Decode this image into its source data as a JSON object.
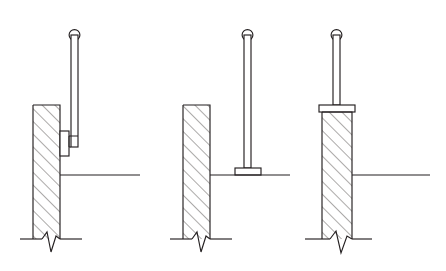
{
  "drawing": {
    "title": "Railing / Standard Mounting Details",
    "sheet_background": "#ffffff",
    "line_color": "#231f20",
    "hatch_color": "#3a3634",
    "style": "line-drawing",
    "figure_count": 3,
    "figures": [
      {
        "id": "figure-1",
        "label": "side-mounted-bracket-detail",
        "description": "Vertical hatched wall section with side-mounted bracket plate supporting a vertical rod with looped top",
        "mounting_type": "side-face bracket",
        "wall": {
          "x": 33,
          "y": 105,
          "width": 27,
          "height": 134,
          "hatch": "45-degree",
          "hatch_spacing": 9
        },
        "rod": {
          "x": 71,
          "top_y": 30,
          "bottom_y": 145,
          "width": 7,
          "loop_radius": 5.5,
          "loop_center_y": 35
        },
        "bracket": {
          "plate_x": 60,
          "plate_y": 131,
          "plate_width": 8,
          "plate_height": 24,
          "arm_y_top": 136,
          "arm_y_bottom": 147,
          "arm_extends_to_x": 78
        },
        "floor_line": {
          "y": 175,
          "x_start": 60,
          "x_end": 140
        },
        "break_symbol": {
          "y": 239,
          "x_left": 20,
          "x_right": 82,
          "type": "zigzag"
        }
      },
      {
        "id": "figure-2",
        "label": "floor-mounted-base-plate-detail",
        "description": "Vertical hatched wall section beside a free-standing post with base plate resting on the floor line",
        "mounting_type": "floor base plate",
        "wall": {
          "x": 183,
          "y": 105,
          "width": 27,
          "height": 134,
          "hatch": "45-degree",
          "hatch_spacing": 9
        },
        "rod": {
          "x": 244,
          "top_y": 30,
          "bottom_y": 168,
          "width": 7,
          "loop_radius": 5.5,
          "loop_center_y": 35
        },
        "base_plate": {
          "x": 235,
          "y": 168,
          "width": 26,
          "height": 7
        },
        "floor_line": {
          "y": 175,
          "x_start": 210,
          "x_end": 290
        },
        "break_symbol": {
          "y": 239,
          "x_left": 170,
          "x_right": 232,
          "type": "zigzag"
        }
      },
      {
        "id": "figure-3",
        "label": "top-mounted-cap-plate-detail",
        "description": "Vertical hatched wall section with a cap plate on top supporting a vertical rod with looped top",
        "mounting_type": "top cap plate",
        "wall": {
          "x": 322,
          "y": 112,
          "width": 30,
          "height": 127,
          "hatch": "45-degree",
          "hatch_spacing": 9
        },
        "cap_plate": {
          "x": 319,
          "y": 105,
          "width": 36,
          "height": 7
        },
        "rod": {
          "x": 333,
          "top_y": 30,
          "bottom_y": 105,
          "width": 7,
          "loop_radius": 5.5,
          "loop_center_y": 35
        },
        "floor_line": {
          "y": 175,
          "x_start": 352,
          "x_end": 430
        },
        "break_symbol": {
          "y": 239,
          "x_left": 305,
          "x_right": 372,
          "type": "zigzag"
        }
      }
    ]
  }
}
